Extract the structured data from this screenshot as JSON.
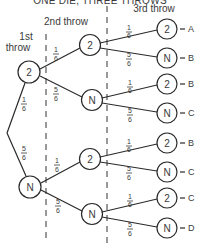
{
  "title": "ONE DIE, THREE THROWS",
  "headers": {
    "first": [
      "1st",
      "throw"
    ],
    "second": "2nd throw",
    "third": "3rd throw"
  },
  "fractions": {
    "one_sixth": {
      "num": "1",
      "den": "6"
    },
    "five_sixths": {
      "num": "5",
      "den": "6"
    }
  },
  "nodes": {
    "level1": [
      {
        "label": "2",
        "prob": "1/6"
      },
      {
        "label": "N",
        "prob": "5/6"
      }
    ],
    "level2": [
      {
        "label": "2",
        "prob": "1/6",
        "parent": 0
      },
      {
        "label": "N",
        "prob": "5/6",
        "parent": 0
      },
      {
        "label": "2",
        "prob": "1/6",
        "parent": 1
      },
      {
        "label": "N",
        "prob": "5/6",
        "parent": 1
      }
    ],
    "level3": [
      {
        "label": "2",
        "prob": "1/6",
        "outcome": "A"
      },
      {
        "label": "N",
        "prob": "5/6",
        "outcome": "B"
      },
      {
        "label": "2",
        "prob": "1/6",
        "outcome": "B"
      },
      {
        "label": "N",
        "prob": "5/6",
        "outcome": "C"
      },
      {
        "label": "2",
        "prob": "1/6",
        "outcome": "B"
      },
      {
        "label": "N",
        "prob": "5/6",
        "outcome": "C"
      },
      {
        "label": "2",
        "prob": "1/6",
        "outcome": "C"
      },
      {
        "label": "N",
        "prob": "5/6",
        "outcome": "D"
      }
    ]
  },
  "colors": {
    "ink": "#2a2a2a",
    "background": "#ffffff"
  }
}
